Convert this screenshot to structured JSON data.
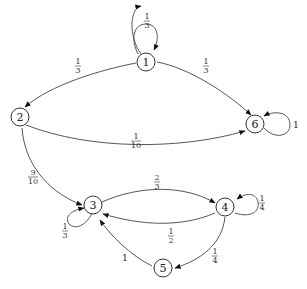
{
  "diagram": {
    "type": "markov-chain",
    "nodes": [
      {
        "id": "1",
        "label": "1"
      },
      {
        "id": "2",
        "label": "2"
      },
      {
        "id": "3",
        "label": "3"
      },
      {
        "id": "4",
        "label": "4"
      },
      {
        "id": "5",
        "label": "5"
      },
      {
        "id": "6",
        "label": "6"
      }
    ],
    "edges": [
      {
        "from": "1",
        "to": "1",
        "num": "1",
        "den": "3"
      },
      {
        "from": "1",
        "to": "2",
        "num": "1",
        "den": "3"
      },
      {
        "from": "1",
        "to": "6",
        "num": "1",
        "den": "3"
      },
      {
        "from": "2",
        "to": "6",
        "num": "1",
        "den": "10"
      },
      {
        "from": "2",
        "to": "3",
        "num": "9",
        "den": "10"
      },
      {
        "from": "6",
        "to": "6",
        "label": "1"
      },
      {
        "from": "3",
        "to": "4",
        "num": "2",
        "den": "3"
      },
      {
        "from": "3",
        "to": "3",
        "num": "1",
        "den": "3"
      },
      {
        "from": "4",
        "to": "4",
        "num": "1",
        "den": "4"
      },
      {
        "from": "4",
        "to": "3",
        "num": "1",
        "den": "2"
      },
      {
        "from": "4",
        "to": "5",
        "num": "1",
        "den": "4"
      },
      {
        "from": "5",
        "to": "3",
        "label": "1"
      }
    ]
  }
}
